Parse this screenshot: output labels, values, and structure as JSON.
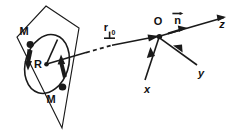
{
  "figure": {
    "kind": "physics-vector-diagram",
    "background_color": "#ffffff",
    "ink_color": "#1a1a1a"
  },
  "labels": {
    "mass_top": "M",
    "mass_bottom": "M",
    "radius": "R",
    "position_vector_base": "r",
    "position_vector_subscript": "0",
    "origin": "O",
    "normal_vector": "n",
    "axis_x": "x",
    "axis_y": "y",
    "axis_z": "z"
  },
  "elements": {
    "plane": "tilted-parallelogram",
    "loop": "ellipse-perspective-circle",
    "loop_direction_arrows": 2,
    "mass_markers": 2,
    "radius_line": "center-to-rim",
    "r0_style": "solid-dashed-solid-with-arrowhead",
    "overbar_vectors": [
      "n"
    ],
    "underbar_vectors": [
      "r0"
    ]
  },
  "geometry": {
    "plane_points": "46,6 78,27 62,128 18,38",
    "loop_center": [
      47,
      64
    ],
    "loop_rx": 21,
    "loop_ry": 30,
    "loop_rotation_deg": 18,
    "origin_point": [
      160,
      36
    ],
    "z_end": [
      226,
      17
    ],
    "x_end": [
      143,
      84
    ],
    "y_end": [
      198,
      66
    ],
    "n_arrow_tip": [
      186,
      27
    ]
  }
}
